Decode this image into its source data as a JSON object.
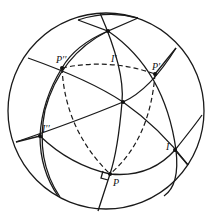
{
  "figure": {
    "labels": {
      "P": "P",
      "P1": "P′",
      "P2": "P′′",
      "I": "I",
      "I1": "I′",
      "I2": "I′′"
    },
    "colors": {
      "stroke": "#1a1a1a",
      "background": "#ffffff"
    }
  }
}
